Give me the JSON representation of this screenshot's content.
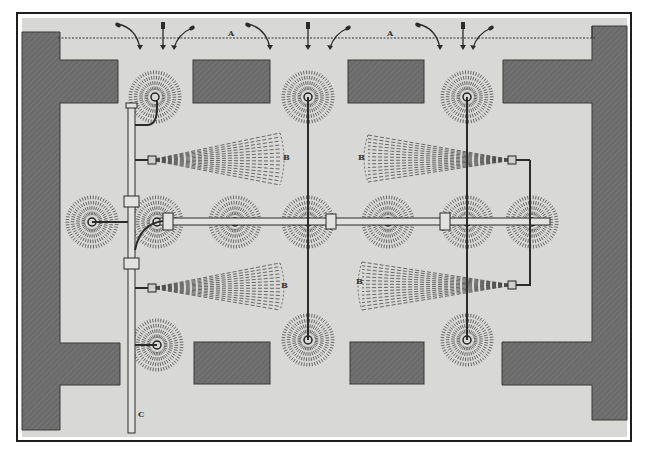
{
  "figure": {
    "kind": "engraved plan diagram",
    "colors": {
      "paper": "#ffffff",
      "frame": "#1e1e1e",
      "plate": "#d8d8d6",
      "wall": "#6b6b6b",
      "wall_hatch": "#8a8a8a",
      "ink": "#2b2b2b"
    }
  },
  "labels": {
    "line_a_1": "A",
    "line_a_2": "A",
    "fan_upper_left": "B",
    "fan_lower_left": "B",
    "fan_upper_right": "B",
    "fan_lower_right": "B",
    "main_pipe": "C"
  },
  "legend": {
    "A": "row of jets along top dashed line",
    "B": "fan-shaped sprays",
    "C": "main supply pipe"
  },
  "components": {
    "rosette_sprinkler_count": 13,
    "fan_spray_count": 4,
    "wall_blocks_count": 4,
    "top_jet_groups": 3
  }
}
